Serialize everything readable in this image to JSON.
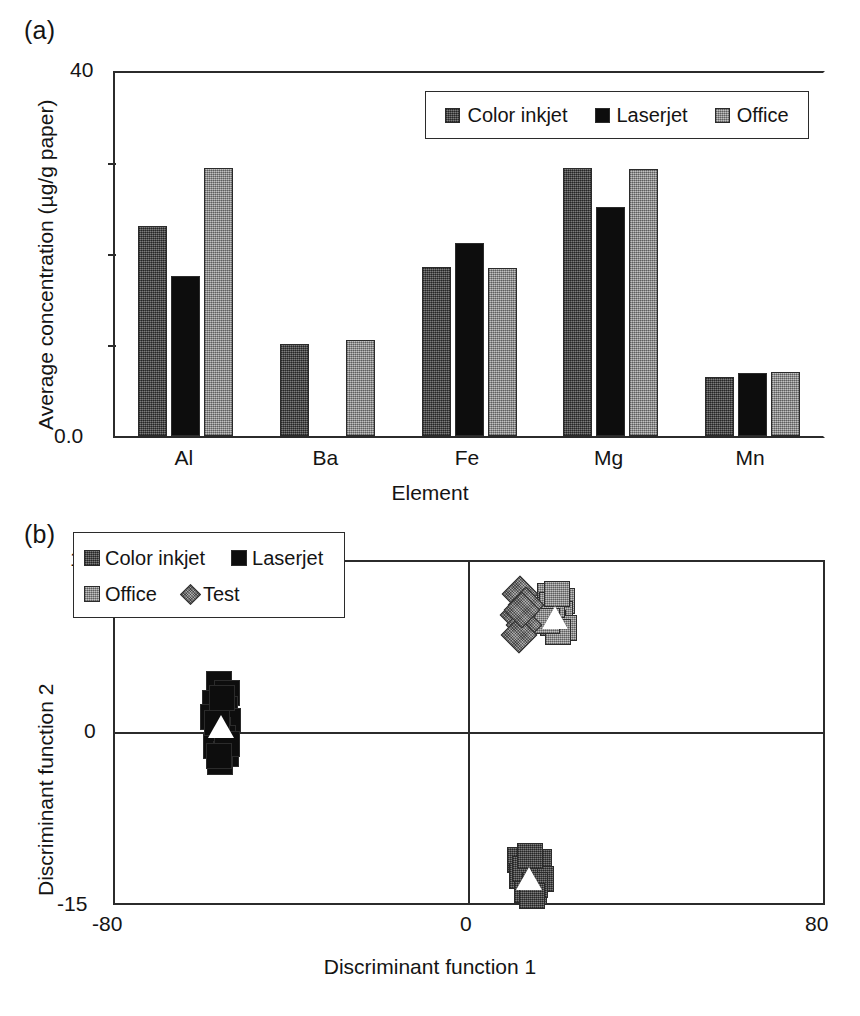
{
  "figure": {
    "panel_a_label": "(a)",
    "panel_b_label": "(b)"
  },
  "chart_data": [
    {
      "id": "panel-a",
      "type": "bar",
      "title": "",
      "xlabel": "Element",
      "ylabel": "Average concentration (µg/g paper)",
      "categories": [
        "Al",
        "Ba",
        "Fe",
        "Mg",
        "Mn"
      ],
      "ylim": [
        0,
        40
      ],
      "ytick_labels": [
        "0.0",
        "40"
      ],
      "ytick_values": [
        0,
        40
      ],
      "minor_ticks": [
        10,
        20,
        30
      ],
      "grid": false,
      "legend_position": "top-right",
      "series": [
        {
          "name": "Color inkjet",
          "color": "#4d4d4d",
          "values": [
            23.1,
            10.1,
            18.6,
            29.5,
            6.5
          ]
        },
        {
          "name": "Laserjet",
          "color": "#0d0d0d",
          "values": [
            17.6,
            null,
            21.3,
            25.2,
            6.9
          ]
        },
        {
          "name": "Office",
          "color": "#9a9a9a",
          "values": [
            29.5,
            10.6,
            18.5,
            29.4,
            7.1
          ]
        }
      ]
    },
    {
      "id": "panel-b",
      "type": "scatter",
      "title": "",
      "xlabel": "Discriminant function 1",
      "ylabel": "Discriminant function 2",
      "xlim": [
        -80,
        80
      ],
      "ylim": [
        -15,
        15
      ],
      "xtick_labels": [
        "-80",
        "0",
        "80"
      ],
      "xtick_values": [
        -80,
        0,
        80
      ],
      "ytick_labels": [
        "15",
        "0",
        "-15"
      ],
      "ytick_values": [
        15,
        0,
        -15
      ],
      "grid": false,
      "axis_crosshair": true,
      "legend_position": "upper-left-inside",
      "series": [
        {
          "name": "Color inkjet",
          "color": "#4d4d4d",
          "marker": "square",
          "centroid": [
            13.5,
            -12.8
          ],
          "points": [
            [
              11.5,
              -11.2
            ],
            [
              15.8,
              -11.4
            ],
            [
              12.0,
              -12.6
            ],
            [
              16.2,
              -12.9
            ],
            [
              13.0,
              -13.9
            ],
            [
              14.8,
              -14.0
            ],
            [
              12.6,
              -12.0
            ],
            [
              15.0,
              -13.4
            ],
            [
              13.8,
              -10.9
            ],
            [
              14.2,
              -14.4
            ]
          ]
        },
        {
          "name": "Laserjet",
          "color": "#0d0d0d",
          "marker": "square",
          "centroid": [
            -56.0,
            0.6
          ],
          "points": [
            [
              -56.6,
              4.3
            ],
            [
              -54.8,
              3.5
            ],
            [
              -57.4,
              2.6
            ],
            [
              -55.2,
              2.1
            ],
            [
              -57.8,
              1.4
            ],
            [
              -54.4,
              1.0
            ],
            [
              -56.8,
              0.2
            ],
            [
              -55.6,
              -0.5
            ],
            [
              -57.2,
              -1.2
            ],
            [
              -55.0,
              -1.9
            ],
            [
              -56.2,
              -2.6
            ],
            [
              -55.8,
              3.0
            ],
            [
              -57.0,
              0.8
            ],
            [
              -54.6,
              -1.0
            ],
            [
              -56.4,
              -2.1
            ]
          ]
        },
        {
          "name": "Office",
          "color": "#9a9a9a",
          "marker": "square",
          "centroid": [
            19.5,
            10.2
          ],
          "points": [
            [
              18.4,
              12.0
            ],
            [
              21.0,
              11.6
            ],
            [
              17.8,
              10.8
            ],
            [
              20.6,
              10.4
            ],
            [
              19.0,
              9.6
            ],
            [
              21.4,
              9.2
            ],
            [
              18.8,
              11.2
            ],
            [
              20.2,
              8.8
            ],
            [
              19.8,
              12.2
            ],
            [
              17.6,
              9.8
            ]
          ]
        },
        {
          "name": "Test",
          "color": "#7d7d7d",
          "marker": "diamond",
          "centroid": null,
          "points": [
            [
              11.6,
              12.2
            ],
            [
              12.8,
              11.2
            ],
            [
              11.0,
              10.3
            ],
            [
              12.4,
              9.5
            ],
            [
              11.2,
              8.6
            ],
            [
              12.0,
              10.8
            ]
          ]
        }
      ]
    }
  ],
  "panel_a": {
    "legend": [
      {
        "label": "Color inkjet",
        "swatch": "inkjet-swatch"
      },
      {
        "label": "Laserjet",
        "swatch": "laserjet-swatch"
      },
      {
        "label": "Office",
        "swatch": "office-swatch"
      }
    ],
    "y_axis": {
      "top_label": "40",
      "bottom_label": "0.0",
      "title": "Average concentration (µg/g paper)"
    },
    "x_axis": {
      "title": "Element",
      "categories": [
        "Al",
        "Ba",
        "Fe",
        "Mg",
        "Mn"
      ]
    }
  },
  "panel_b": {
    "legend": [
      {
        "label": "Color inkjet",
        "swatch": "inkjet-swatch"
      },
      {
        "label": "Laserjet",
        "swatch": "laserjet-swatch"
      },
      {
        "label": "Office",
        "swatch": "office-swatch"
      },
      {
        "label": "Test",
        "swatch": "test-diamond-swatch"
      }
    ],
    "y_axis": {
      "top_label": "15",
      "mid_label": "0",
      "bottom_label": "-15",
      "title": "Discriminant function 2"
    },
    "x_axis": {
      "left_label": "-80",
      "mid_label": "0",
      "right_label": "80",
      "title": "Discriminant function 1"
    }
  }
}
